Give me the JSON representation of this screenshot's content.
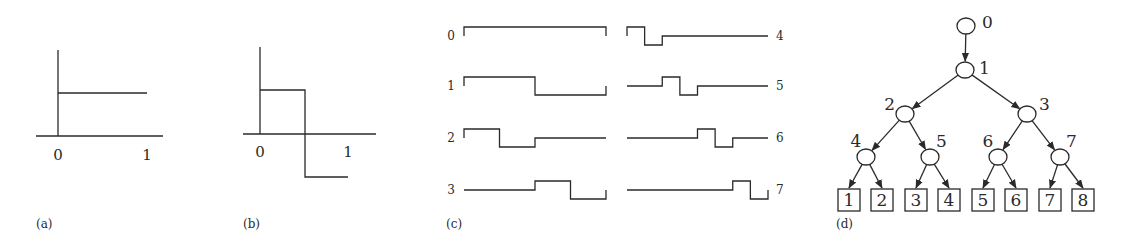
{
  "panels": {
    "a": {
      "caption": "(a)",
      "title": "Scaling function",
      "ticks": [
        "0",
        "1"
      ],
      "function": {
        "x": [
          0,
          1
        ],
        "y": [
          1,
          1
        ]
      }
    },
    "b": {
      "caption": "(b)",
      "title": "Mother wavelet",
      "ticks": [
        "0",
        "1"
      ],
      "function": {
        "segments": [
          {
            "from": 0,
            "to": 0.5,
            "value": 1
          },
          {
            "from": 0.5,
            "to": 1,
            "value": -1
          }
        ]
      }
    },
    "c": {
      "caption": "(c)",
      "waveforms": [
        {
          "label": "0",
          "levels": [
            1,
            1,
            1,
            1,
            1,
            1,
            1,
            1
          ]
        },
        {
          "label": "1",
          "levels": [
            1,
            1,
            1,
            1,
            -1,
            -1,
            -1,
            -1
          ]
        },
        {
          "label": "2",
          "levels": [
            1,
            1,
            -1,
            -1,
            0,
            0,
            0,
            0
          ]
        },
        {
          "label": "3",
          "levels": [
            0,
            0,
            0,
            0,
            1,
            1,
            -1,
            -1
          ]
        },
        {
          "label": "4",
          "levels": [
            1,
            -1,
            0,
            0,
            0,
            0,
            0,
            0
          ]
        },
        {
          "label": "5",
          "levels": [
            0,
            0,
            1,
            -1,
            0,
            0,
            0,
            0
          ]
        },
        {
          "label": "6",
          "levels": [
            0,
            0,
            0,
            0,
            1,
            -1,
            0,
            0
          ]
        },
        {
          "label": "7",
          "levels": [
            0,
            0,
            0,
            0,
            0,
            0,
            1,
            -1
          ]
        }
      ]
    },
    "d": {
      "caption": "(d)",
      "nodes": [
        {
          "id": 0,
          "label": "0"
        },
        {
          "id": 1,
          "label": "1",
          "parent": 0
        },
        {
          "id": 2,
          "label": "2",
          "parent": 1
        },
        {
          "id": 3,
          "label": "3",
          "parent": 1
        },
        {
          "id": 4,
          "label": "4",
          "parent": 2
        },
        {
          "id": 5,
          "label": "5",
          "parent": 2
        },
        {
          "id": 6,
          "label": "6",
          "parent": 3
        },
        {
          "id": 7,
          "label": "7",
          "parent": 3
        }
      ],
      "leaves": [
        {
          "label": "1",
          "parent": 4
        },
        {
          "label": "2",
          "parent": 4
        },
        {
          "label": "3",
          "parent": 5
        },
        {
          "label": "4",
          "parent": 5
        },
        {
          "label": "5",
          "parent": 6
        },
        {
          "label": "6",
          "parent": 6
        },
        {
          "label": "7",
          "parent": 7
        },
        {
          "label": "8",
          "parent": 7
        }
      ]
    }
  }
}
